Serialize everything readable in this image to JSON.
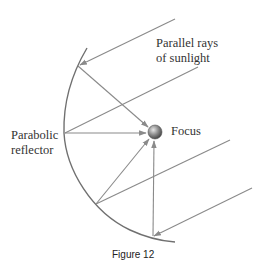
{
  "figure": {
    "labels": {
      "rays_line1": "Parallel rays",
      "rays_line2": "of sunlight",
      "reflector_line1": "Parabolic",
      "reflector_line2": "reflector",
      "focus": "Focus"
    },
    "caption": "Figure 12"
  },
  "colors": {
    "parabola": "#707070",
    "rays": "#8a8a8a",
    "arrowhead": "#7f7f7f",
    "focus_fill": "#6a6a6a",
    "text": "#333333"
  }
}
